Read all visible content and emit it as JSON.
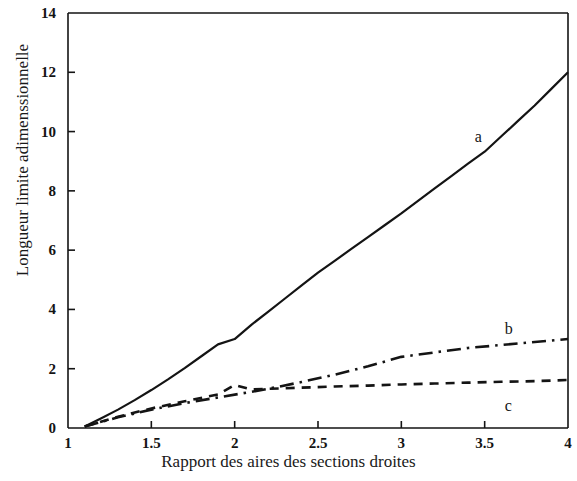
{
  "chart_data": {
    "type": "line",
    "title": "",
    "xlabel": "Rapport des aires des sections droites",
    "ylabel": "Longueur limite adimenssionnelle",
    "xlim": [
      1,
      4
    ],
    "ylim": [
      0,
      14
    ],
    "grid": false,
    "legend_position": "inline-annotations",
    "xticks": [
      "1",
      "1.5",
      "2",
      "2.5",
      "3",
      "3.5",
      "4"
    ],
    "xtick_values": [
      1,
      1.5,
      2,
      2.5,
      3,
      3.5,
      4
    ],
    "yticks": [
      "0",
      "2",
      "4",
      "6",
      "8",
      "10",
      "12",
      "14"
    ],
    "ytick_values": [
      0,
      2,
      4,
      6,
      8,
      10,
      12,
      14
    ],
    "series": [
      {
        "name": "a",
        "label": "a",
        "style": "solid",
        "color": "#141414",
        "label_x": 3.44,
        "label_y": 9.8,
        "x": [
          1.1,
          1.2,
          1.3,
          1.4,
          1.5,
          1.6,
          1.7,
          1.8,
          1.9,
          2.0,
          2.1,
          2.2,
          2.3,
          2.4,
          2.5,
          2.6,
          2.7,
          2.8,
          2.9,
          3.0,
          3.1,
          3.2,
          3.3,
          3.4,
          3.5,
          3.6,
          3.7,
          3.8,
          3.9,
          4.0
        ],
        "values": [
          0.05,
          0.33,
          0.62,
          0.94,
          1.28,
          1.64,
          2.02,
          2.42,
          2.82,
          3.0,
          3.48,
          3.92,
          4.36,
          4.8,
          5.24,
          5.64,
          6.04,
          6.44,
          6.84,
          7.24,
          7.66,
          8.08,
          8.5,
          8.92,
          9.32,
          9.84,
          10.36,
          10.88,
          11.44,
          12.0
        ]
      },
      {
        "name": "b",
        "label": "b",
        "style": "dash-dot",
        "color": "#141414",
        "label_x": 3.62,
        "label_y": 3.3,
        "x": [
          1.1,
          1.3,
          1.5,
          1.7,
          1.9,
          2.1,
          2.2,
          2.4,
          2.6,
          2.8,
          3.0,
          3.2,
          3.4,
          3.6,
          3.8,
          4.0
        ],
        "values": [
          0.05,
          0.36,
          0.62,
          0.84,
          1.03,
          1.22,
          1.32,
          1.55,
          1.8,
          2.08,
          2.4,
          2.55,
          2.7,
          2.8,
          2.9,
          3.0
        ]
      },
      {
        "name": "c",
        "label": "c",
        "style": "dashed",
        "color": "#141414",
        "label_x": 3.62,
        "label_y": 0.72,
        "x": [
          1.1,
          1.3,
          1.5,
          1.7,
          1.9,
          2.0,
          2.1,
          2.2,
          2.4,
          2.6,
          2.8,
          3.0,
          3.2,
          3.4,
          3.6,
          3.8,
          4.0
        ],
        "values": [
          0.05,
          0.38,
          0.66,
          0.9,
          1.13,
          1.45,
          1.3,
          1.32,
          1.36,
          1.4,
          1.43,
          1.47,
          1.5,
          1.53,
          1.56,
          1.58,
          1.62
        ]
      }
    ],
    "axes_color": "#141414",
    "background": "#ffffff"
  }
}
